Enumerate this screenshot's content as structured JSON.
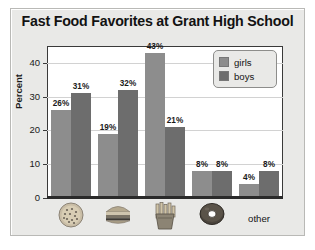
{
  "chart_data": {
    "type": "bar",
    "title": "Fast Food Favorites at Grant High School",
    "xlabel": "",
    "ylabel": "Percent",
    "categories": [
      "pizza",
      "hamburger",
      "french fries",
      "donut",
      "other"
    ],
    "category_icons": [
      "pizza-icon",
      "hamburger-icon",
      "french-fries-icon",
      "donut-icon",
      null
    ],
    "category_labels": [
      "",
      "",
      "",
      "",
      "other"
    ],
    "series": [
      {
        "name": "girls",
        "color": "#8d8d8d",
        "values": [
          26,
          19,
          43,
          8,
          4
        ]
      },
      {
        "name": "boys",
        "color": "#6d6d6d",
        "values": [
          31,
          32,
          21,
          8,
          8
        ]
      }
    ],
    "value_suffix": "%",
    "data_labels": [
      [
        "26%",
        "19%",
        "43%",
        "8%",
        "4%"
      ],
      [
        "31%",
        "32%",
        "21%",
        "8%",
        "8%"
      ]
    ],
    "ylim": [
      0,
      45
    ],
    "yticks": [
      0,
      10,
      20,
      30,
      40
    ],
    "ytick_labels": [
      "0",
      "10",
      "20",
      "30",
      "40"
    ],
    "grid": true,
    "legend_position": "top-right"
  },
  "legend": {
    "items": [
      {
        "label": "girls",
        "color": "#8d8d8d"
      },
      {
        "label": "boys",
        "color": "#6d6d6d"
      }
    ]
  }
}
